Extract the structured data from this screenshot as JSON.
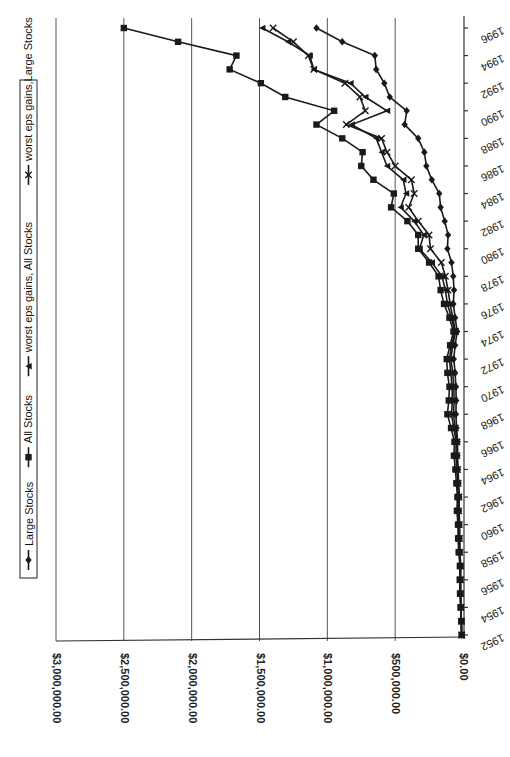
{
  "chart_data": {
    "type": "line",
    "orientation": "rotated-90",
    "title": "",
    "xlabel": "",
    "ylabel": "",
    "x": [
      1952,
      1953,
      1954,
      1955,
      1956,
      1957,
      1958,
      1959,
      1960,
      1961,
      1962,
      1963,
      1964,
      1965,
      1966,
      1967,
      1968,
      1969,
      1970,
      1971,
      1972,
      1973,
      1974,
      1975,
      1976,
      1977,
      1978,
      1979,
      1980,
      1981,
      1982,
      1983,
      1984,
      1985,
      1986,
      1987,
      1988,
      1989,
      1990,
      1991,
      1992,
      1993,
      1994,
      1995,
      1996
    ],
    "x_tick_labels": [
      "1952",
      "1954",
      "1956",
      "1958",
      "1960",
      "1962",
      "1964",
      "1966",
      "1968",
      "1970",
      "1972",
      "1974",
      "1976",
      "1978",
      "1980",
      "1982",
      "1984",
      "1986",
      "1988",
      "1990",
      "1992",
      "1994",
      "1996"
    ],
    "y_tick_labels": [
      "$0.00",
      "$500,000.00",
      "$1,000,000.00",
      "$1,500,000.00",
      "$2,000,000.00",
      "$2,500,000.00",
      "$3,000,000.00"
    ],
    "ylim": [
      0,
      3000000
    ],
    "grid": true,
    "legend_position": "left (top after rotation)",
    "series": [
      {
        "name": "Large Stocks",
        "marker": "diamond",
        "values": [
          10000,
          12000,
          15000,
          17000,
          18000,
          17000,
          22000,
          24000,
          25000,
          28000,
          27000,
          32000,
          36000,
          40000,
          39000,
          47000,
          52000,
          50000,
          52000,
          58000,
          68000,
          58000,
          43000,
          58000,
          71000,
          66000,
          72000,
          85000,
          115000,
          110000,
          135000,
          165000,
          175000,
          230000,
          270000,
          285000,
          330000,
          430000,
          415000,
          540000,
          580000,
          640000,
          650000,
          890000,
          1080000
        ]
      },
      {
        "name": "All Stocks",
        "marker": "square",
        "values": [
          10000,
          13000,
          18000,
          22000,
          24000,
          23000,
          32000,
          36000,
          37000,
          45000,
          41000,
          49000,
          56000,
          67000,
          63000,
          88000,
          115000,
          105000,
          100000,
          115000,
          120000,
          95000,
          70000,
          100000,
          140000,
          165000,
          180000,
          250000,
          330000,
          330000,
          410000,
          530000,
          510000,
          660000,
          750000,
          740000,
          890000,
          1080000,
          950000,
          1310000,
          1490000,
          1720000,
          1670000,
          2100000,
          2500000
        ]
      },
      {
        "name": "worst eps gains, All Stocks",
        "marker": "triangle",
        "values": [
          10000,
          12000,
          16000,
          19000,
          20000,
          19000,
          26000,
          29000,
          30000,
          36000,
          33000,
          40000,
          45000,
          52000,
          50000,
          68000,
          85000,
          78000,
          80000,
          90000,
          100000,
          85000,
          60000,
          85000,
          115000,
          130000,
          155000,
          230000,
          320000,
          290000,
          360000,
          460000,
          420000,
          440000,
          560000,
          600000,
          640000,
          820000,
          560000,
          720000,
          830000,
          1100000,
          1130000,
          1290000,
          1480000
        ]
      },
      {
        "name": "worst eps gains,Large Stocks",
        "marker": "x",
        "values": [
          10000,
          12000,
          15000,
          18000,
          19000,
          18000,
          24000,
          26000,
          27000,
          32000,
          30000,
          36000,
          40000,
          45000,
          44000,
          57000,
          70000,
          65000,
          68000,
          75000,
          90000,
          75000,
          55000,
          75000,
          95000,
          110000,
          130000,
          160000,
          240000,
          250000,
          330000,
          400000,
          360000,
          380000,
          500000,
          560000,
          600000,
          860000,
          720000,
          760000,
          870000,
          1100000,
          1140000,
          1250000,
          1400000
        ]
      }
    ]
  },
  "legend": {
    "items": [
      {
        "label": "Large Stocks",
        "marker": "diamond"
      },
      {
        "label": "All Stocks",
        "marker": "square"
      },
      {
        "label": "worst eps gains, All Stocks",
        "marker": "triangle"
      },
      {
        "label": "worst eps gains,Large Stocks",
        "marker": "x"
      }
    ]
  },
  "colors": {
    "line": "#1a1a1a",
    "grid": "#555555",
    "background": "#ffffff"
  }
}
